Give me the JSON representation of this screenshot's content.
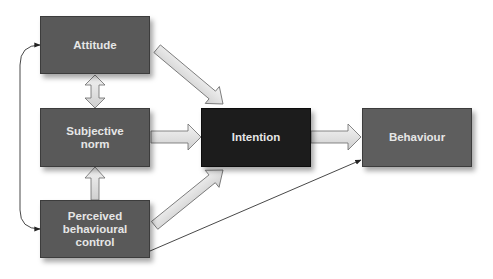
{
  "diagram": {
    "nodes": {
      "attitude": {
        "label": "Attitude"
      },
      "subjective_norm": {
        "line1": "Subjective",
        "line2": "norm"
      },
      "perceived_control": {
        "line1": "Perceived",
        "line2": "behavioural",
        "line3": "control"
      },
      "intention": {
        "label": "Intention"
      },
      "behaviour": {
        "label": "Behaviour"
      }
    },
    "edges": [
      {
        "from": "Attitude",
        "to": "Intention",
        "style": "block-arrow"
      },
      {
        "from": "Subjective norm",
        "to": "Intention",
        "style": "block-arrow"
      },
      {
        "from": "Perceived behavioural control",
        "to": "Intention",
        "style": "block-arrow"
      },
      {
        "from": "Intention",
        "to": "Behaviour",
        "style": "block-arrow"
      },
      {
        "from": "Attitude",
        "to": "Subjective norm",
        "style": "double-block-arrow"
      },
      {
        "from": "Perceived behavioural control",
        "to": "Subjective norm",
        "style": "block-arrow"
      },
      {
        "from": "Perceived behavioural control",
        "to": "Behaviour",
        "style": "thin-arrow"
      },
      {
        "from": "Attitude",
        "to": "Perceived behavioural control",
        "style": "thin-double-curved-arrow"
      }
    ],
    "colors": {
      "box_grey": "#595959",
      "box_dark": "#1c1c1c",
      "box_text": "#e6e6e6",
      "arrow_fill": "#e2e2e2",
      "arrow_stroke": "#6a6a6a",
      "line": "#333333"
    }
  }
}
